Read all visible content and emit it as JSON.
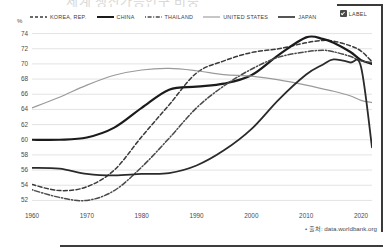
{
  "title_faint": "세계 생산가능인구 비중",
  "axis": {
    "unit_label": "%",
    "y_ticks": [
      74,
      72,
      70,
      68,
      66,
      64,
      62,
      60,
      58,
      56,
      54,
      52
    ],
    "y_min": 51,
    "y_max": 75,
    "x_ticks": [
      1960,
      1970,
      1980,
      1990,
      2000,
      2010,
      2020
    ],
    "x_min": 1960,
    "x_max": 2022
  },
  "legend": {
    "items": [
      {
        "label": "KOREA, REP.",
        "style": "dashed",
        "color": "#3a3a3a"
      },
      {
        "label": "CHINA",
        "style": "solid-thick",
        "color": "#1b1b1b"
      },
      {
        "label": "THAILAND",
        "style": "dash-dot",
        "color": "#4a4a4a"
      },
      {
        "label": "UNITED STATES",
        "style": "solid-thin",
        "color": "#8e8e8e"
      },
      {
        "label": "JAPAN",
        "style": "solid-medium",
        "color": "#2a2a2a"
      }
    ],
    "checkbox_label": "LABEL",
    "checkbox_checked": true
  },
  "source_note": "• 출처: data.worldbank.org",
  "colors": {
    "grid": "#e3e3e3",
    "text": "#4a4a4a",
    "frame": "#3a3a3a"
  },
  "chart_data": {
    "type": "line",
    "title": "",
    "xlabel": "",
    "ylabel": "%",
    "xlim": [
      1960,
      2022
    ],
    "ylim": [
      51,
      75
    ],
    "grid": true,
    "legend_position": "top",
    "x": [
      1960,
      1965,
      1970,
      1975,
      1980,
      1985,
      1990,
      1995,
      2000,
      2005,
      2010,
      2013,
      2015,
      2018,
      2020,
      2022
    ],
    "series": [
      {
        "name": "KOREA, REP.",
        "style": "dashed",
        "values": [
          54.1,
          53.3,
          53.8,
          56.0,
          60.4,
          64.6,
          68.8,
          70.4,
          71.5,
          72.0,
          72.8,
          73.1,
          73.0,
          72.4,
          71.7,
          70.3
        ]
      },
      {
        "name": "CHINA",
        "style": "solid-thick",
        "values": [
          60.0,
          60.0,
          60.3,
          61.6,
          64.2,
          66.6,
          67.0,
          67.4,
          68.5,
          71.2,
          73.5,
          73.3,
          72.8,
          71.6,
          70.5,
          70.0
        ]
      },
      {
        "name": "THAILAND",
        "style": "dash-dot",
        "values": [
          53.4,
          52.4,
          52.0,
          53.3,
          56.4,
          60.2,
          64.2,
          67.1,
          69.3,
          70.9,
          71.6,
          71.8,
          71.6,
          71.0,
          70.4,
          70.2
        ]
      },
      {
        "name": "UNITED STATES",
        "style": "solid-thin",
        "values": [
          64.2,
          65.6,
          67.2,
          68.5,
          69.2,
          69.4,
          69.1,
          68.6,
          68.4,
          67.9,
          67.2,
          66.7,
          66.4,
          65.8,
          65.2,
          64.9
        ]
      },
      {
        "name": "JAPAN",
        "style": "solid-medium",
        "values": [
          56.3,
          56.2,
          55.5,
          55.3,
          55.5,
          55.6,
          56.6,
          58.6,
          61.4,
          65.3,
          68.6,
          69.9,
          70.6,
          70.2,
          69.6,
          59.0
        ]
      }
    ]
  }
}
